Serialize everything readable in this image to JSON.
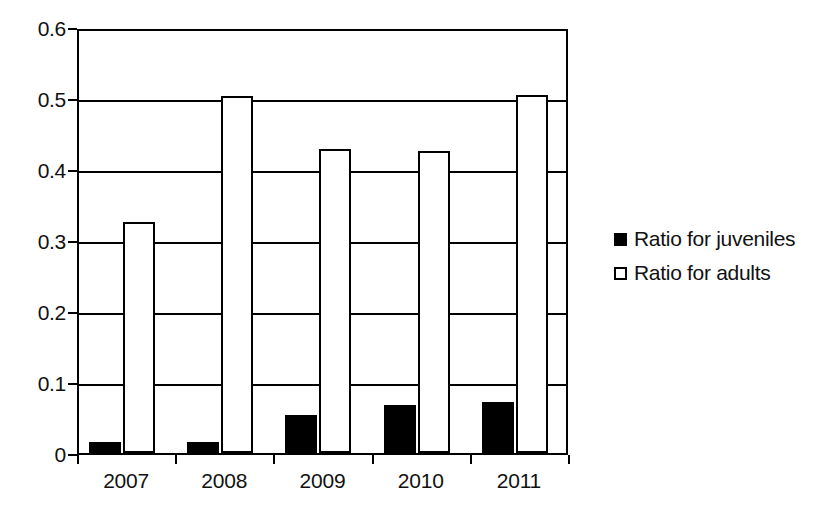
{
  "chart_data": {
    "type": "bar",
    "title": "",
    "subtitle": "",
    "xlabel": "",
    "ylabel": "",
    "categories": [
      "2007",
      "2008",
      "2009",
      "2010",
      "2011"
    ],
    "series": [
      {
        "name": "Ratio for juveniles",
        "swatch": "filled-square",
        "color": "#000000",
        "values": [
          0.015,
          0.016,
          0.054,
          0.067,
          0.072
        ]
      },
      {
        "name": "Ratio for adults",
        "swatch": "hollow-square",
        "color": "#ffffff",
        "values": [
          0.326,
          0.503,
          0.428,
          0.425,
          0.504
        ]
      }
    ],
    "ylim": [
      0,
      0.6
    ],
    "yticks": [
      0,
      0.1,
      0.2,
      0.3,
      0.4,
      0.5,
      0.6
    ],
    "ytick_labels": [
      "0",
      "0.1",
      "0.2",
      "0.3",
      "0.4",
      "0.5",
      "0.6"
    ],
    "grid": true,
    "grid_axis": "y",
    "legend_position": "right",
    "annotations": []
  },
  "legend": {
    "entries": [
      {
        "label": "Ratio for juveniles"
      },
      {
        "label": "Ratio for adults"
      }
    ]
  }
}
